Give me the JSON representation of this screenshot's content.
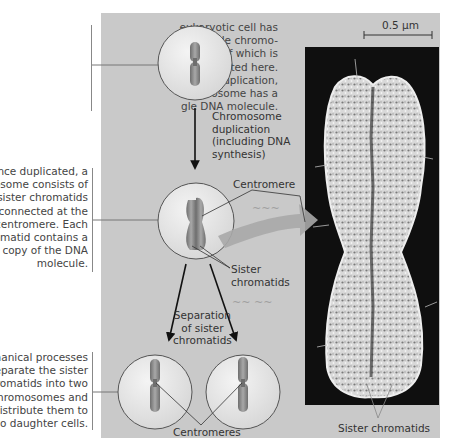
{
  "notes": {
    "top": "eukaryotic cell has\n multiple chromo-\nes, one of which is\nrepresented here.\nefore duplication,\nchromosome has a\ngle DNA molecule.",
    "middle": "Once duplicated, a\nnosome consists of\no sister chromatids\nconnected at the\ncentromere. Each\nromatid contains a\ncopy of the DNA\nmolecule.",
    "bottom": "echanical processes\nseparate the sister\nhromatids into two\nchromosomes and\ndistribute them to\ntwo daughter cells."
  },
  "labels": {
    "duplication": "Chromosome\nduplication\n(including DNA\nsynthesis)",
    "centromere": "Centromere",
    "sister_chromatids": "Sister\nchromatids",
    "separation": "Separation\nof sister\nchromatids",
    "centromeres": "Centromeres",
    "photo_sister_chromatids": "Sister chromatids",
    "scale_bar": "0.5 µm"
  },
  "colors": {
    "panel": "#c9c9c9",
    "cell_fill": "#e4e4e4",
    "chromosome": "#8a8a8a",
    "arrow": "#a8a8a8",
    "photo_bg": "#0f0f0f"
  }
}
